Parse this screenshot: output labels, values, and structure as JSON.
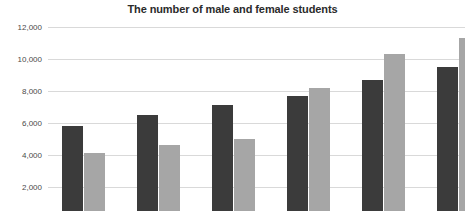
{
  "chart_data": {
    "type": "bar",
    "title": "The number of male and female students",
    "xlabel": "",
    "ylabel": "",
    "ylim": [
      0,
      12000
    ],
    "grid": true,
    "legend_position": "none",
    "y_ticks": [
      12000,
      10000,
      8000,
      6000,
      4000,
      2000
    ],
    "y_tick_labels": [
      "12,000",
      "10,000",
      "8,000",
      "6,000",
      "4,000",
      "2,000"
    ],
    "categories": [
      "1",
      "2",
      "3",
      "4",
      "5",
      "6"
    ],
    "series": [
      {
        "name": "male",
        "color": "#3b3b3b",
        "values": [
          5300,
          6000,
          6600,
          7200,
          8200,
          9000
        ]
      },
      {
        "name": "female",
        "color": "#a6a6a6",
        "values": [
          3600,
          4100,
          4500,
          7700,
          9800,
          10800
        ]
      }
    ],
    "note": "chart is cropped at bottom; x-axis category labels and legend are not visible"
  },
  "colors": {
    "background": "#ffffff",
    "title": "#2b2b2b",
    "gridline": "#d9d9d9",
    "tick_label": "#4a4a4a"
  }
}
